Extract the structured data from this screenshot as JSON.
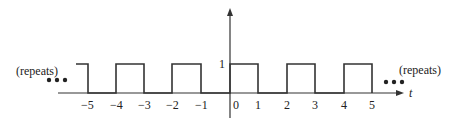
{
  "diagram": {
    "type": "periodic-square-wave",
    "axis": {
      "x_label": "t",
      "y_tick_label": "1"
    },
    "x_ticks": [
      "−5",
      "−4",
      "−3",
      "−2",
      "−1",
      "0",
      "1",
      "2",
      "3",
      "4",
      "5"
    ],
    "annotations": {
      "left": "(repeats)",
      "right": "(repeats)",
      "ellipsis": "•••"
    },
    "signal": {
      "high": 1,
      "low": 0,
      "high_intervals": [
        [
          -5.4,
          -5
        ],
        [
          -4,
          -3
        ],
        [
          -2,
          -1
        ],
        [
          0,
          1
        ],
        [
          2,
          3
        ],
        [
          4,
          5
        ]
      ]
    },
    "colors": {
      "line": "#333333",
      "text": "#222222"
    }
  }
}
